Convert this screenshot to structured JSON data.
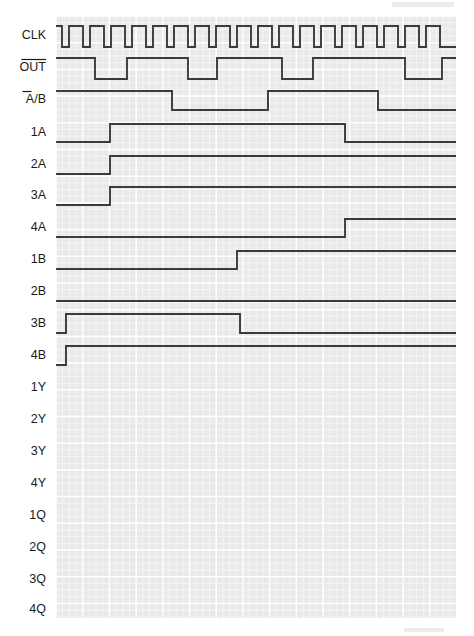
{
  "figure": {
    "type": "digital-timing-diagram",
    "title": "",
    "grid": {
      "x_start": 56,
      "x_end": 456,
      "y_start": 16,
      "y_end": 618,
      "major_px": 26.7,
      "minor_divisions": 4,
      "background": "#e9e9e9",
      "major_line_color": "#ffffff",
      "minor_line_color": "#f7f7f7"
    },
    "waveform_color": "#3b3b3b",
    "label_color": "#1a1a1a",
    "signals": [
      {
        "name": "CLK",
        "label": "CLK",
        "overbar": "none",
        "row_center": 36,
        "high_y": 26,
        "low_y": 47,
        "initial": 1,
        "transitions": [
          62,
          69,
          83,
          90,
          104,
          111,
          125,
          132,
          146,
          153,
          167,
          174,
          188,
          195,
          209,
          216,
          230,
          237,
          251,
          258,
          272,
          279,
          293,
          300,
          314,
          321,
          335,
          342,
          356,
          363,
          377,
          384,
          398,
          405,
          419,
          426,
          440
        ]
      },
      {
        "name": "OUT",
        "label": "OUT",
        "overbar": "full",
        "row_center": 68,
        "high_y": 58,
        "low_y": 79,
        "initial": 1,
        "transitions": [
          95,
          127,
          188,
          217,
          282,
          313,
          405,
          442
        ]
      },
      {
        "name": "A/B",
        "label": "A/B",
        "overbar": "first",
        "row_center": 100,
        "high_y": 91,
        "low_y": 110,
        "initial": 1,
        "transitions": [
          172,
          268,
          378
        ]
      },
      {
        "name": "1A",
        "label": "1A",
        "overbar": "none",
        "row_center": 133,
        "high_y": 124,
        "low_y": 142,
        "initial": 0,
        "transitions": [
          110,
          345
        ]
      },
      {
        "name": "2A",
        "label": "2A",
        "overbar": "none",
        "row_center": 165,
        "high_y": 156,
        "low_y": 174,
        "initial": 0,
        "transitions": [
          110
        ]
      },
      {
        "name": "3A",
        "label": "3A",
        "overbar": "none",
        "row_center": 196,
        "high_y": 187,
        "low_y": 205,
        "initial": 0,
        "transitions": [
          110
        ]
      },
      {
        "name": "4A",
        "label": "4A",
        "overbar": "none",
        "row_center": 228,
        "high_y": 219,
        "low_y": 237,
        "initial": 0,
        "transitions": [
          345
        ]
      },
      {
        "name": "1B",
        "label": "1B",
        "overbar": "none",
        "row_center": 260,
        "high_y": 251,
        "low_y": 269,
        "initial": 0,
        "transitions": [
          237
        ]
      },
      {
        "name": "2B",
        "label": "2B",
        "overbar": "none",
        "row_center": 292,
        "high_y": 283,
        "low_y": 301,
        "initial": 0,
        "transitions": []
      },
      {
        "name": "3B",
        "label": "3B",
        "overbar": "none",
        "row_center": 324,
        "high_y": 314,
        "low_y": 333,
        "initial": 0,
        "transitions": [
          66,
          240
        ]
      },
      {
        "name": "4B",
        "label": "4B",
        "overbar": "none",
        "row_center": 356,
        "high_y": 346,
        "low_y": 365,
        "initial": 0,
        "transitions": [
          66
        ]
      },
      {
        "name": "1Y",
        "label": "1Y",
        "overbar": "none",
        "row_center": 388,
        "high_y": 379,
        "low_y": 397,
        "initial": null,
        "transitions": []
      },
      {
        "name": "2Y",
        "label": "2Y",
        "overbar": "none",
        "row_center": 420,
        "high_y": 411,
        "low_y": 429,
        "initial": null,
        "transitions": []
      },
      {
        "name": "3Y",
        "label": "3Y",
        "overbar": "none",
        "row_center": 452,
        "high_y": 443,
        "low_y": 461,
        "initial": null,
        "transitions": []
      },
      {
        "name": "4Y",
        "label": "4Y",
        "overbar": "none",
        "row_center": 484,
        "high_y": 475,
        "low_y": 493,
        "initial": null,
        "transitions": []
      },
      {
        "name": "1Q",
        "label": "1Q",
        "overbar": "none",
        "row_center": 516,
        "high_y": 507,
        "low_y": 525,
        "initial": null,
        "transitions": []
      },
      {
        "name": "2Q",
        "label": "2Q",
        "overbar": "none",
        "row_center": 548,
        "high_y": 539,
        "low_y": 557,
        "initial": null,
        "transitions": []
      },
      {
        "name": "3Q",
        "label": "3Q",
        "overbar": "none",
        "row_center": 580,
        "high_y": 571,
        "low_y": 589,
        "initial": null,
        "transitions": []
      },
      {
        "name": "4Q",
        "label": "4Q",
        "overbar": "none",
        "row_center": 610,
        "high_y": 601,
        "low_y": 618,
        "initial": null,
        "transitions": []
      }
    ]
  }
}
